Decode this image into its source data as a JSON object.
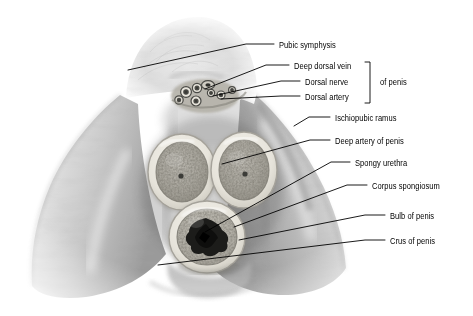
{
  "figure": {
    "kind": "anatomical-cross-section-photograph",
    "background_color": "#ffffff",
    "ink_color": "#000000",
    "tone": "grayscale"
  },
  "labels": [
    {
      "id": "pubic-symphysis",
      "text": "Pubic symphysis",
      "x": 279,
      "y": 47,
      "leader": [
        [
          274,
          44
        ],
        [
          246,
          44
        ],
        [
          128,
          70
        ]
      ]
    },
    {
      "id": "deep-dorsal-vein",
      "text": "Deep dorsal vein",
      "x": 294,
      "y": 68,
      "leader": [
        [
          289,
          65
        ],
        [
          266,
          65
        ],
        [
          205,
          89
        ]
      ]
    },
    {
      "id": "dorsal-nerve",
      "text": "Dorsal nerve",
      "x": 305,
      "y": 84,
      "leader": [
        [
          300,
          81
        ],
        [
          281,
          81
        ],
        [
          213,
          96
        ]
      ]
    },
    {
      "id": "dorsal-artery",
      "text": "Dorsal artery",
      "x": 305,
      "y": 99,
      "leader": [
        [
          300,
          96
        ],
        [
          281,
          96
        ],
        [
          221,
          99
        ]
      ]
    },
    {
      "id": "of-penis-group",
      "text": "of penis",
      "x": 380,
      "y": 84,
      "leader": null
    },
    {
      "id": "ischiopubic-ramus",
      "text": "Ischiopubic ramus",
      "x": 335,
      "y": 120,
      "leader": [
        [
          330,
          117
        ],
        [
          309,
          117
        ],
        [
          294,
          126
        ]
      ]
    },
    {
      "id": "deep-artery",
      "text": "Deep artery of penis",
      "x": 335,
      "y": 143,
      "leader": [
        [
          330,
          140
        ],
        [
          310,
          140
        ],
        [
          222,
          164
        ]
      ]
    },
    {
      "id": "spongy-urethra",
      "text": "Spongy urethra",
      "x": 355,
      "y": 165,
      "leader": [
        [
          350,
          162
        ],
        [
          331,
          162
        ],
        [
          205,
          232
        ]
      ]
    },
    {
      "id": "corpus-spongiosum",
      "text": "Corpus spongiosum",
      "x": 372,
      "y": 188,
      "leader": [
        [
          367,
          185
        ],
        [
          347,
          185
        ],
        [
          234,
          227
        ]
      ]
    },
    {
      "id": "bulb-of-penis",
      "text": "Bulb of penis",
      "x": 390,
      "y": 218,
      "leader": [
        [
          385,
          215
        ],
        [
          365,
          215
        ],
        [
          239,
          240
        ]
      ]
    },
    {
      "id": "crus-of-penis",
      "text": "Crus of penis",
      "x": 390,
      "y": 243,
      "leader": [
        [
          385,
          240
        ],
        [
          365,
          240
        ],
        [
          158,
          265
        ]
      ]
    }
  ],
  "bracket": {
    "id": "of-penis-bracket",
    "x": 370,
    "y_top": 62,
    "y_bottom": 103,
    "tick": 5,
    "groups": [
      "Deep dorsal vein",
      "Dorsal nerve",
      "Dorsal artery"
    ],
    "label": "of penis"
  },
  "structures": [
    {
      "id": "corpus-cavernosum-left",
      "label": "Crus / corpus cavernosum (left)",
      "cx": 182,
      "cy": 172
    },
    {
      "id": "corpus-cavernosum-right",
      "label": "Crus / corpus cavernosum (right)",
      "cx": 244,
      "cy": 170
    },
    {
      "id": "corpus-spongiosum-body",
      "label": "Bulb / corpus spongiosum",
      "cx": 207,
      "cy": 237
    },
    {
      "id": "urethral-lumen",
      "label": "Spongy urethra lumen",
      "cx": 206,
      "cy": 234
    },
    {
      "id": "neurovascular-bundle",
      "label": "Dorsal neurovascular bundle",
      "cx": 205,
      "cy": 96
    },
    {
      "id": "pubic-region",
      "label": "Pubic symphysis region",
      "cx": 175,
      "cy": 50
    },
    {
      "id": "thigh-left",
      "label": "Left thigh mass",
      "cx": 75,
      "cy": 215
    },
    {
      "id": "thigh-right",
      "label": "Right thigh mass",
      "cx": 300,
      "cy": 200
    }
  ]
}
